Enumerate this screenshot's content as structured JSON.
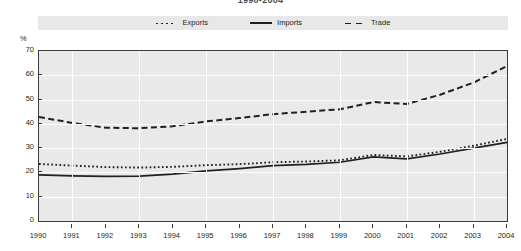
{
  "chart_data": {
    "type": "line",
    "title": "1990-2004",
    "ylabel": "%",
    "xlabel": "",
    "ylim": [
      0,
      70
    ],
    "ytick_values": [
      0,
      10,
      20,
      30,
      40,
      50,
      60,
      70
    ],
    "grid": true,
    "legend_position": "top-center",
    "categories": [
      "1990",
      "1991",
      "1992",
      "1993",
      "1994",
      "1995",
      "1996",
      "1997",
      "1998",
      "1999",
      "2000",
      "2001",
      "2002",
      "2003",
      "2004"
    ],
    "x": [
      1990,
      1991,
      1992,
      1993,
      1994,
      1995,
      1996,
      1997,
      1998,
      1999,
      2000,
      2001,
      2002,
      2003,
      2004
    ],
    "series": [
      {
        "name": "Exports",
        "style": "dotted",
        "color": "#231f20",
        "values": [
          23.5,
          22.8,
          22.2,
          22.0,
          22.3,
          23.0,
          23.4,
          24.2,
          24.5,
          25.0,
          27.2,
          26.6,
          28.5,
          31.0,
          33.8
        ]
      },
      {
        "name": "Imports",
        "style": "solid",
        "color": "#231f20",
        "values": [
          19.0,
          18.6,
          18.4,
          18.5,
          19.3,
          20.6,
          21.6,
          22.8,
          23.3,
          24.2,
          26.4,
          25.6,
          27.6,
          30.0,
          32.4
        ]
      },
      {
        "name": "Trade",
        "style": "dashed",
        "color": "#231f20",
        "values": [
          42.8,
          40.4,
          38.4,
          38.2,
          39.0,
          41.0,
          42.4,
          44.0,
          45.0,
          46.0,
          49.0,
          48.2,
          52.0,
          57.0,
          63.8
        ]
      }
    ],
    "annotations": []
  },
  "legend": {
    "items": [
      {
        "label": "Exports",
        "marker": "dotted-line-swatch"
      },
      {
        "label": "Imports",
        "marker": "solid-line-swatch"
      },
      {
        "label": "Trade",
        "marker": "dashed-line-swatch"
      }
    ]
  },
  "colors": {
    "plot_background": "#e9e9e9",
    "legend_background": "#e8e8e8",
    "gridline": "#ffffff",
    "axis": "#3a3a3a",
    "series": "#231f20",
    "page_background": "#ffffff"
  }
}
